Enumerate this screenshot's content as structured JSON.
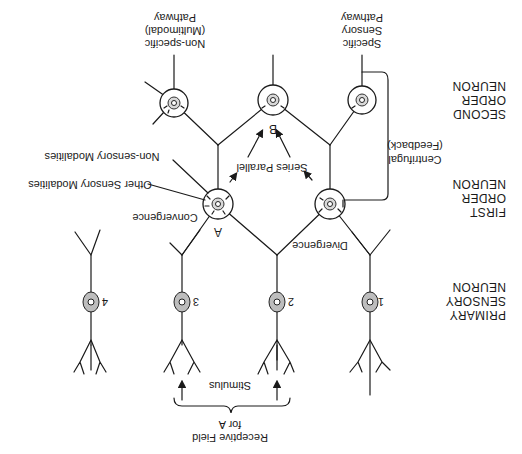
{
  "diagram": {
    "orientation": "rotated-180",
    "levels": [
      {
        "id": "primary",
        "lines": [
          "PRIMARY",
          "SENSORY",
          "NEURON"
        ]
      },
      {
        "id": "first",
        "lines": [
          "FIRST",
          "ORDER",
          "NEURON"
        ]
      },
      {
        "id": "second",
        "lines": [
          "SECOND",
          "ORDER",
          "NEURON"
        ]
      }
    ],
    "primary_neurons": [
      {
        "label": "1"
      },
      {
        "label": "2"
      },
      {
        "label": "3"
      },
      {
        "label": "4"
      }
    ],
    "first_order_neurons": [
      {
        "label": "A"
      },
      {
        "label": ""
      }
    ],
    "second_order_neurons": [
      {
        "label": ""
      },
      {
        "label": "B"
      },
      {
        "label": ""
      }
    ],
    "pathways": {
      "specific": [
        "Specific",
        "Sensory",
        "Pathway"
      ],
      "nonspecific": [
        "Non-specific",
        "(Multimodal)",
        "Pathway"
      ]
    },
    "annotations": {
      "divergence": "Divergence",
      "convergence": "Convergence",
      "other_sensory": "Other Sensory Modalities",
      "non_sensory": "Non-sensory Modalities",
      "series_parallel": "Series Parallel",
      "centrifugal": "Centrifugal",
      "feedback": "(Feedback)",
      "stimulus": "Stimulus",
      "receptive_field": [
        "Receptive Field",
        "for A"
      ]
    },
    "colors": {
      "line": "#1a1a1a",
      "soma_fill": "#bdbdbd",
      "background": "#ffffff"
    }
  }
}
